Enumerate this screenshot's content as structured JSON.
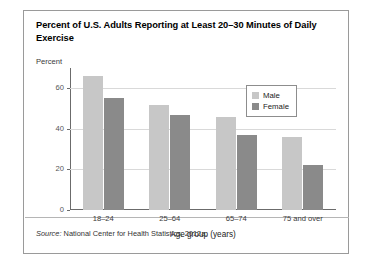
{
  "figure": {
    "title": "Percent of U.S. Adults Reporting at Least 20–30 Minutes of Daily Exercise",
    "y_axis_caption": "Percent",
    "source_prefix": "Source:",
    "source_text": " National Center for Health Statistics, 2012a."
  },
  "legend": {
    "items": [
      {
        "label": "Male",
        "color": "#c7c7c7"
      },
      {
        "label": "Female",
        "color": "#8a8a8a"
      }
    ]
  },
  "chart_data": {
    "type": "bar",
    "title": "Percent of U.S. Adults Reporting at Least 20–30 Minutes of Daily Exercise",
    "xlabel": "Age group (years)",
    "ylabel": "Percent",
    "categories": [
      "18–24",
      "25–64",
      "65–74",
      "75 and over"
    ],
    "series": [
      {
        "name": "Male",
        "color": "#c7c7c7",
        "values": [
          66,
          52,
          46,
          36
        ]
      },
      {
        "name": "Female",
        "color": "#8a8a8a",
        "values": [
          55,
          47,
          37,
          22
        ]
      }
    ],
    "ylim": [
      0,
      70
    ],
    "yticks": [
      0,
      20,
      40,
      60
    ],
    "ytick_labels": [
      "0",
      "20",
      "40",
      "60"
    ],
    "grid": true,
    "legend_position": "top-right"
  }
}
